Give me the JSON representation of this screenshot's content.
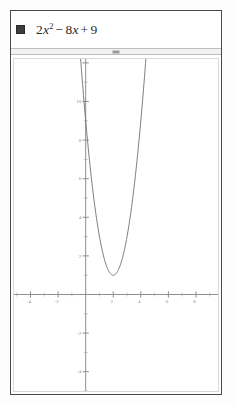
{
  "window": {
    "title": "graph-window"
  },
  "entry": {
    "color": "#3d3d3d",
    "swatch_name": "function-color-swatch",
    "equation_text": "2x² − 8x + 9",
    "coef_a": "2",
    "var": "x",
    "exponent": "2",
    "op1": "−",
    "coef_b": "8",
    "var2": "x",
    "op2": "+",
    "const": "9"
  },
  "splitter": {
    "handle_name": "splitter-handle"
  },
  "chart_data": {
    "type": "line",
    "title": "",
    "subtitle": "",
    "xlabel": "",
    "ylabel": "",
    "function": "y = 2x^2 - 8x + 9",
    "coefficients": {
      "a": 2,
      "b": -8,
      "c": 9
    },
    "vertex": [
      2,
      1
    ],
    "xlim": [
      -5.2,
      9.6
    ],
    "ylim": [
      -5.0,
      12.2
    ],
    "grid": false,
    "legend_position": "none",
    "x_tick_step": 2,
    "y_tick_step": 2,
    "x_minor_step": 1,
    "y_minor_step": 1,
    "x_tick_labels": [
      "-4",
      "-2",
      "2",
      "4",
      "6",
      "8"
    ],
    "x_tick_values": [
      -4,
      -2,
      2,
      4,
      6,
      8
    ],
    "y_tick_labels": [
      "10",
      "8",
      "6",
      "4",
      "2",
      "-2",
      "-4"
    ],
    "y_tick_values": [
      10,
      8,
      6,
      4,
      2,
      -2,
      -4
    ],
    "series": [
      {
        "name": "2x^2 - 8x + 9",
        "color": "#6f6f6f",
        "x": [
          -0.4,
          -0.2,
          0.0,
          0.4,
          0.8,
          1.2,
          1.6,
          2.0,
          2.4,
          2.8,
          3.2,
          3.6,
          4.0,
          4.4,
          4.6
        ],
        "values": [
          12.52,
          10.68,
          9.0,
          6.12,
          3.88,
          2.28,
          1.32,
          1.0,
          1.32,
          2.28,
          3.88,
          6.12,
          9.0,
          12.52,
          14.92
        ]
      }
    ]
  }
}
